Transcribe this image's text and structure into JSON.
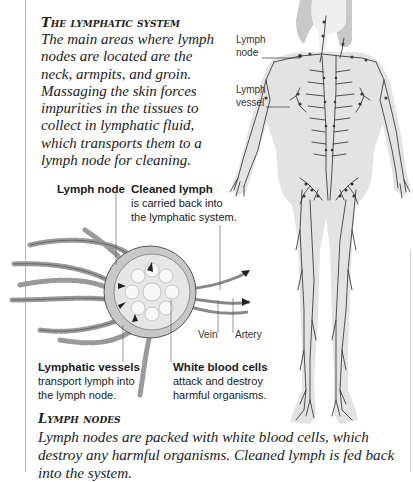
{
  "page": {
    "intro": {
      "heading": "The lymphatic system",
      "body": "The main areas where lymph nodes are located are the neck, armpits, and groin. Massaging the skin forces impurities in the tissues to collect in lymphatic fluid, which transports them to a lymph node for cleaning."
    },
    "body_figure": {
      "labels": [
        {
          "title": "Lymph",
          "line2": "node"
        },
        {
          "title": "Lymph",
          "line2": "vessel"
        }
      ]
    },
    "node_diagram": {
      "labels": {
        "lymph_node": {
          "title": "Lymph node"
        },
        "cleaned_lymph": {
          "title": "Cleaned lymph",
          "text": "is carried back into the lymphatic system."
        },
        "vein": {
          "title": "Vein"
        },
        "artery": {
          "title": "Artery"
        },
        "lymphatic_vessels": {
          "title": "Lymphatic vessels",
          "text": "transport lymph into the lymph node."
        },
        "white_blood_cells": {
          "title": "White blood cells",
          "text": "attack and destroy harmful organisms."
        }
      }
    },
    "outro": {
      "heading": "Lymph nodes",
      "body": "Lymph nodes are packed with white blood cells, which destroy any harmful organisms. Cleaned lymph is fed back into the system."
    }
  }
}
